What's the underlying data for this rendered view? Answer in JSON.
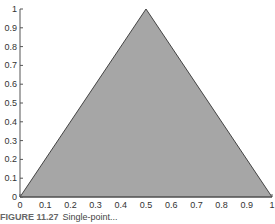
{
  "chart_data": {
    "type": "area",
    "title": "",
    "xlabel": "",
    "ylabel": "",
    "x": [
      0,
      0.5,
      1
    ],
    "series": [
      {
        "name": "triangle",
        "values": [
          0,
          1,
          0
        ],
        "fill": "#a6a6a6",
        "stroke": "#444444"
      }
    ],
    "xlim": [
      0,
      1
    ],
    "ylim": [
      0,
      1
    ],
    "xticks": [
      "0",
      "0.1",
      "0.2",
      "0.3",
      "0.4",
      "0.5",
      "0.6",
      "0.7",
      "0.8",
      "0.9",
      "1"
    ],
    "yticks": [
      "0",
      "0.1",
      "0.2",
      "0.3",
      "0.4",
      "0.5",
      "0.6",
      "0.7",
      "0.8",
      "0.9",
      "1"
    ],
    "grid": false,
    "legend": null
  },
  "caption": {
    "label": "FIGURE 11.27",
    "text": "Single-point..."
  }
}
